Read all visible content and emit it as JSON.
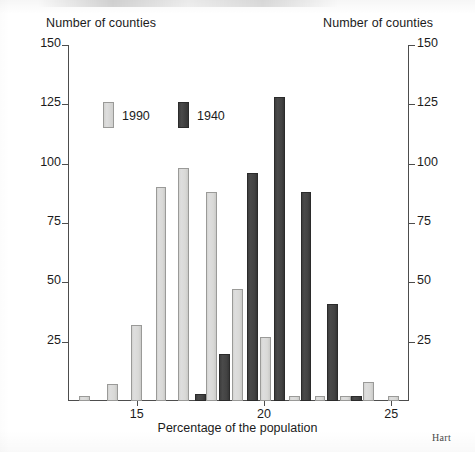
{
  "credit": "Hart",
  "chart_data": {
    "type": "bar",
    "title": "",
    "subtitle": "",
    "ylabel_left": "Number of counties",
    "ylabel_right": "Number of counties",
    "xlabel": "Percentage of the population",
    "xlim": [
      12.3,
      25.7
    ],
    "ylim": [
      0,
      150
    ],
    "grid": false,
    "legend_position": "top-left-inside",
    "yticks": [
      0,
      25,
      50,
      75,
      100,
      125,
      150
    ],
    "ytick_labels": [
      "",
      "25",
      "50",
      "75",
      "100",
      "125",
      "150"
    ],
    "xticks": [
      15,
      20,
      25
    ],
    "xtick_labels": [
      "15",
      "20",
      "25"
    ],
    "colors": {
      "series_1990": "#d8d8d6",
      "series_1990_edge": "#9a9a98",
      "series_1940": "#434343",
      "series_1940_edge": "#2b2b2b",
      "axis": "#4d4d4d",
      "text": "#1b1b1b"
    },
    "series": [
      {
        "name": "1990",
        "color": "#d8d8d6",
        "bar_width": 0.42,
        "points": [
          {
            "x": 12.95,
            "y": 2
          },
          {
            "x": 14.05,
            "y": 7
          },
          {
            "x": 15.0,
            "y": 32
          },
          {
            "x": 15.95,
            "y": 90
          },
          {
            "x": 16.85,
            "y": 98
          },
          {
            "x": 17.95,
            "y": 88
          },
          {
            "x": 18.95,
            "y": 47
          },
          {
            "x": 20.05,
            "y": 27
          },
          {
            "x": 21.2,
            "y": 2
          },
          {
            "x": 22.2,
            "y": 2
          },
          {
            "x": 23.2,
            "y": 2
          },
          {
            "x": 24.1,
            "y": 8
          },
          {
            "x": 25.1,
            "y": 2
          }
        ]
      },
      {
        "name": "1940",
        "color": "#434343",
        "bar_width": 0.42,
        "points": [
          {
            "x": 17.5,
            "y": 3
          },
          {
            "x": 18.45,
            "y": 20
          },
          {
            "x": 19.55,
            "y": 96
          },
          {
            "x": 20.6,
            "y": 128
          },
          {
            "x": 21.65,
            "y": 88
          },
          {
            "x": 22.7,
            "y": 41
          },
          {
            "x": 23.65,
            "y": 2
          }
        ]
      }
    ],
    "legend": [
      {
        "label": "1990",
        "color": "#d8d8d6"
      },
      {
        "label": "1940",
        "color": "#434343"
      }
    ]
  }
}
